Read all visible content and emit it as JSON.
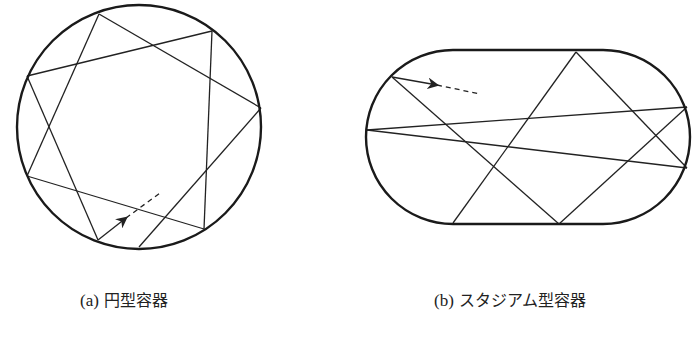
{
  "figure": {
    "panels": [
      {
        "id": "a",
        "caption_label": "(a)",
        "caption_text": "円型容器",
        "container": {
          "shape": "circle",
          "cx": 139,
          "cy": 127,
          "r": 122
        },
        "chords": [
          [
            99,
            14,
            27,
            176
          ],
          [
            99,
            14,
            261,
            108
          ],
          [
            27,
            76,
            212,
            31
          ],
          [
            212,
            31,
            204,
            229
          ],
          [
            261,
            108,
            139,
            247
          ],
          [
            27,
            176,
            204,
            229
          ],
          [
            27,
            76,
            98,
            240
          ]
        ],
        "arrow": {
          "from": [
            98,
            240
          ],
          "head": [
            126,
            218
          ],
          "dash_to": [
            160,
            193
          ]
        }
      },
      {
        "id": "b",
        "caption_label": "(b)",
        "caption_text": "スタジアム型容器",
        "container": {
          "shape": "stadium",
          "x_left": 366,
          "x_right": 692,
          "y_top": 50,
          "y_bottom": 224,
          "radius": 87
        },
        "chords": [
          [
            392,
            77,
            559,
            224
          ],
          [
            367,
            130,
            687,
            107
          ],
          [
            367,
            130,
            687,
            168
          ],
          [
            453,
            223,
            576,
            52
          ],
          [
            576,
            52,
            687,
            168
          ],
          [
            559,
            224,
            687,
            107
          ]
        ],
        "arrow": {
          "from": [
            392,
            77
          ],
          "head": [
            437,
            85
          ],
          "dash_to": [
            480,
            94
          ]
        }
      }
    ],
    "colors": {
      "stroke": "#222222",
      "boundary": "#1a1a1a",
      "background": "#ffffff"
    }
  }
}
